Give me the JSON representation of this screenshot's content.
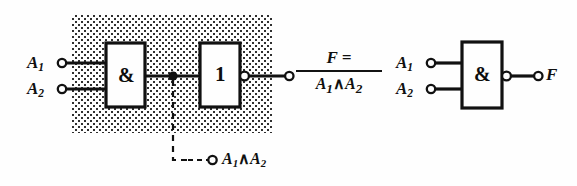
{
  "figure": {
    "left_circuit": {
      "name": "and-plus-inverter",
      "shaded_region": true,
      "inputs": [
        {
          "name": "input-a1",
          "label": "A",
          "sub": "1"
        },
        {
          "name": "input-a2",
          "label": "A",
          "sub": "2"
        }
      ],
      "gates": [
        {
          "name": "and-gate",
          "symbol": "&",
          "inverted_output": false
        },
        {
          "name": "inverter-gate",
          "symbol": "1",
          "inverted_output": true
        }
      ],
      "tap": {
        "name": "intermediate-tap",
        "label_a": "A",
        "sub_a": "1",
        "operator": "∧",
        "label_b": "A",
        "sub_b": "2",
        "dashed": true
      },
      "output": {
        "name": "output-expression",
        "numerator": "F =",
        "denominator_a": "A",
        "denominator_sub_a": "1",
        "denominator_operator": "∧",
        "denominator_b": "A",
        "denominator_sub_b": "2"
      }
    },
    "right_circuit": {
      "name": "nand-gate-symbol",
      "inputs": [
        {
          "name": "input-a1",
          "label": "A",
          "sub": "1"
        },
        {
          "name": "input-a2",
          "label": "A",
          "sub": "2"
        }
      ],
      "gate": {
        "name": "nand-gate",
        "symbol": "&",
        "inverted_output": true
      },
      "output": {
        "name": "output-f",
        "label": "F"
      }
    },
    "colors": {
      "ink": "#111111",
      "paper": "#fefefe",
      "stipple": "#2b2b2b"
    }
  }
}
